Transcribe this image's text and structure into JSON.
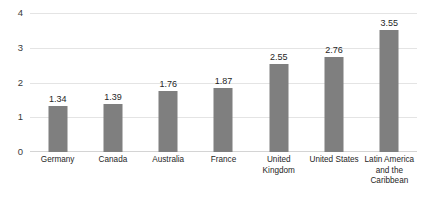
{
  "chart_data": {
    "type": "bar",
    "title": "",
    "subtitle": "",
    "xlabel": "",
    "ylabel": "",
    "categories": [
      "Germany",
      "Canada",
      "Australia",
      "France",
      "United Kingdom",
      "United States",
      "Latin America and the Caribbean"
    ],
    "values": [
      1.34,
      1.39,
      1.76,
      1.87,
      2.55,
      2.76,
      3.55
    ],
    "data_labels": [
      "1.34",
      "1.39",
      "1.76",
      "1.87",
      "2.55",
      "2.76",
      "3.55"
    ],
    "ylim": [
      0,
      4
    ],
    "yticks": [
      0,
      1,
      2,
      3,
      4
    ],
    "ytick_labels": [
      "0",
      "1",
      "2",
      "3",
      "4"
    ],
    "grid": true,
    "grid_axis": "y",
    "legend": false,
    "legend_position": "none",
    "bar_color": "#7f7f7f",
    "gridline_color": "#e4e4e4",
    "background_color": "#ffffff",
    "text_color": "#262626",
    "annotations": []
  }
}
